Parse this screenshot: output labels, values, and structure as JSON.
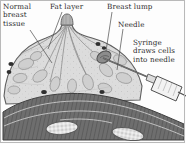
{
  "figure": {
    "type": "medical-illustration",
    "width": 186,
    "height": 144,
    "style": "grayscale pen-and-ink cross-section",
    "border_color": "#b9b9b9",
    "background_color": "#fdfdfd",
    "text_color": "#2b2b2b"
  },
  "labels": {
    "normal_breast_tissue": "Normal\nbreast\ntissue",
    "fat_layer": "Fat layer",
    "breast_lump": "Breast lump",
    "needle": "Needle",
    "syringe": "Syringe\ndraws cells\ninto needle"
  },
  "anatomy": {
    "parts": [
      "skin",
      "nipple",
      "fat layer",
      "lobules and ducts",
      "breast lump",
      "lymph nodes",
      "pectoral muscle",
      "rib"
    ],
    "colors": {
      "skin_outline": "#6a6a6a",
      "fat": "#d9d9d9",
      "gland": "#c4c4c4",
      "duct": "#9a9a9a",
      "lump": "#8f8f8f",
      "lymph_node": "#3a3a3a",
      "muscle": "#6f6f6f",
      "rib": "#efefef",
      "syringe_body": "#f2f2f2",
      "needle": "#555555"
    }
  },
  "leader_lines": [
    {
      "label": "normal-breast-tissue",
      "from": [
        34,
        28
      ],
      "to": [
        52,
        62
      ]
    },
    {
      "label": "fat-layer",
      "from": [
        60,
        13
      ],
      "to": [
        46,
        50
      ]
    },
    {
      "label": "breast-lump",
      "from": [
        110,
        13
      ],
      "to": [
        105,
        52
      ]
    },
    {
      "label": "needle",
      "from": [
        121,
        30
      ],
      "to": [
        116,
        72
      ]
    }
  ]
}
